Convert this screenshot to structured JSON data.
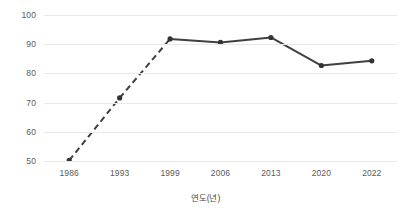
{
  "chart_data": {
    "type": "line",
    "title": "",
    "xlabel": "연도(년)",
    "ylabel": "현역 판정률(퍼센트)",
    "categories": [
      "1986",
      "1993",
      "1999",
      "2006",
      "2013",
      "2020",
      "2022"
    ],
    "values": [
      50.2,
      71.6,
      91.8,
      90.6,
      92.3,
      82.7,
      84.3
    ],
    "series": [
      {
        "name": "현역 판정률",
        "values": [
          50.2,
          71.6,
          91.8,
          90.6,
          92.3,
          82.7,
          84.3
        ]
      }
    ],
    "ylim": [
      50,
      100
    ],
    "yticks": [
      "50",
      "60",
      "70",
      "80",
      "90",
      "100"
    ],
    "ytick_values": [
      50,
      60,
      70,
      80,
      90,
      100
    ],
    "xticks": [
      "1986",
      "1993",
      "1999",
      "2006",
      "2013",
      "2020",
      "2022"
    ],
    "grid": true,
    "legend": "none",
    "line_style_segments": [
      "dashed",
      "dashed",
      "solid",
      "solid",
      "solid",
      "solid"
    ],
    "colors": {
      "line": "#404040",
      "marker": "#333333",
      "grid": "#e9e9e9",
      "tick_text": "#5a5a5a",
      "axis_title_text": "#4a4a4a",
      "background": "#ffffff"
    }
  },
  "axis": {
    "y_title": "현역 판정률(퍼센트)",
    "x_title": "연도(년)",
    "y_labels": [
      "100",
      "90",
      "80",
      "70",
      "60",
      "50"
    ],
    "x_labels": [
      "1986",
      "1993",
      "1999",
      "2006",
      "2013",
      "2020",
      "2022"
    ]
  }
}
